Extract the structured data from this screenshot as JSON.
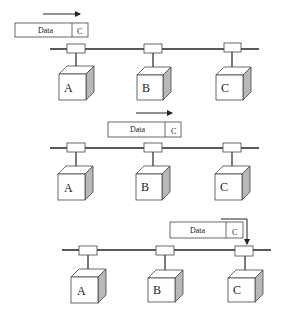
{
  "diagram": {
    "type": "bus-network-frame-delivery",
    "colors": {
      "line": "#222222",
      "box_fill": "#ffffff",
      "cube_side": "#b8b8b8",
      "cube_top": "#ffffff"
    },
    "stages": [
      {
        "packet": {
          "data_label": "Data",
          "dest_label": "C"
        },
        "arrow": "right",
        "nodes": [
          {
            "label": "A"
          },
          {
            "label": "B"
          },
          {
            "label": "C"
          }
        ]
      },
      {
        "packet": {
          "data_label": "Data",
          "dest_label": "C"
        },
        "arrow": "right",
        "nodes": [
          {
            "label": "A"
          },
          {
            "label": "B"
          },
          {
            "label": "C"
          }
        ]
      },
      {
        "packet": {
          "data_label": "Data",
          "dest_label": "C"
        },
        "arrow": "down-into-node-C",
        "nodes": [
          {
            "label": "A"
          },
          {
            "label": "B"
          },
          {
            "label": "C"
          }
        ]
      }
    ]
  }
}
